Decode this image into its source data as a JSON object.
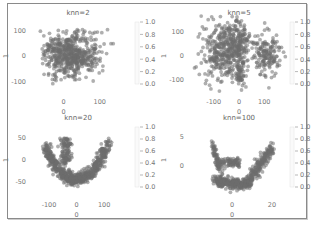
{
  "chart_data": [
    {
      "type": "scatter",
      "title": "knn=2",
      "xlabel": "0",
      "ylabel": "1",
      "xticks": [
        "0",
        "100"
      ],
      "xtick_values": [
        0,
        100
      ],
      "yticks": [
        "100",
        "0",
        "-100"
      ],
      "ytick_values": [
        100,
        0,
        -100
      ],
      "xlim": [
        -70,
        150
      ],
      "ylim": [
        -140,
        140
      ],
      "colorbar": {
        "ticks": [
          "1.0",
          "0.8",
          "0.6",
          "0.4",
          "0.2",
          "0.0"
        ],
        "range": [
          0,
          1
        ]
      },
      "shape": "blob",
      "point_color": "#6e6e6e"
    },
    {
      "type": "scatter",
      "title": "knn=5",
      "xlabel": "0",
      "ylabel": "1",
      "xticks": [
        "-100",
        "0",
        "100"
      ],
      "xtick_values": [
        -100,
        0,
        100
      ],
      "yticks": [
        "100",
        "0",
        "-100"
      ],
      "ytick_values": [
        100,
        0,
        -100
      ],
      "xlim": [
        -170,
        170
      ],
      "ylim": [
        -150,
        150
      ],
      "colorbar": {
        "ticks": [
          "1.0",
          "0.8",
          "0.6",
          "0.4",
          "0.2",
          "0.0"
        ],
        "range": [
          0,
          1
        ]
      },
      "shape": "clusters",
      "point_color": "#6e6e6e"
    },
    {
      "type": "scatter",
      "title": "knn=20",
      "xlabel": "0",
      "ylabel": "1",
      "xticks": [
        "-100",
        "0",
        "100"
      ],
      "xtick_values": [
        -100,
        0,
        100
      ],
      "yticks": [
        "50",
        "0",
        "-50"
      ],
      "ytick_values": [
        50,
        0,
        -50
      ],
      "xlim": [
        -140,
        150
      ],
      "ylim": [
        -80,
        80
      ],
      "colorbar": {
        "ticks": [
          "1.0",
          "0.8",
          "0.6",
          "0.4",
          "0.2",
          "0.0"
        ],
        "range": [
          0,
          1
        ]
      },
      "shape": "u-curve",
      "point_color": "#6e6e6e"
    },
    {
      "type": "scatter",
      "title": "knn=100",
      "xlabel": "0",
      "ylabel": "1",
      "xticks": [
        "0",
        "20"
      ],
      "xtick_values": [
        0,
        20
      ],
      "yticks": [
        "5",
        "0"
      ],
      "ytick_values": [
        5,
        0
      ],
      "xlim": [
        -18,
        25
      ],
      "ylim": [
        -5,
        7
      ],
      "colorbar": {
        "ticks": [
          "1.0",
          "0.8",
          "0.6",
          "0.4",
          "0.2",
          "0.0"
        ],
        "range": [
          0,
          1
        ]
      },
      "shape": "hook",
      "point_color": "#6e6e6e"
    }
  ]
}
